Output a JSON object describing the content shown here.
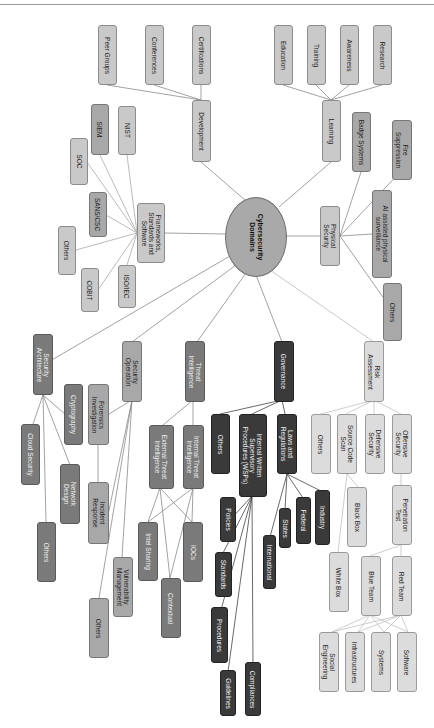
{
  "header": {
    "note": ""
  },
  "center": {
    "label": "Cybersecurity\nDomains"
  },
  "colors": {
    "light": "#c9c9c9",
    "lighter": "#dcdcdc",
    "mid": "#7a7a7a",
    "midlight": "#a8a8a8",
    "dark": "#3a3a3a",
    "edge": "#8a8a8a"
  },
  "nodes": {
    "development": "Development",
    "certifications": "Certifications",
    "conferences": "Conferences",
    "peer_groups": "Peer Groups",
    "learning": "Learning",
    "education": "Education",
    "training": "Training",
    "awareness": "Awareness",
    "research": "Research",
    "badge_systems": "Badge Systems",
    "fire_suppression": "Fire\nSuppression",
    "physical_security": "Physical\nSecurity",
    "ai_surveillance": "AI assisted physical\nsurveillance",
    "physical_others": "Others",
    "frameworks": "Frameworks,\nStandards and\nSoftware",
    "nist": "NIST",
    "siem": "SIEM",
    "soc": "SOC",
    "sans": "SANS/CSC",
    "fw_others": "Others",
    "cobit": "COBIT",
    "iso": "ISO/IEC",
    "security_architecture": "Security\nArchitecture",
    "cryptography": "Cryptography",
    "cloud_security": "Cloud Security",
    "network_design": "Network\nDesign",
    "arch_others": "Others",
    "security_operation": "Security\nOperation",
    "forensics": "Forensics\nInvestigation",
    "incident_response": "Incident\nResponse",
    "vulnerability_management": "Vulnerability\nManagement",
    "ops_others": "Others",
    "threat_intelligence": "Threat\nIntelligence",
    "external_ti": "External Threat\nIntelligence",
    "internal_ti": "Internal Threat\nIntelligence",
    "intel_sharing": "Intel Sharing",
    "iocs": "IOCs",
    "contextual": "Contextual",
    "governance": "Governance",
    "gov_others": "Others",
    "wsp": "Internal Written\nSupervisory\nProcedures (WSPs)",
    "laws": "Laws and\nRegulations",
    "policies": "Policies",
    "standards": "Standards",
    "procedures": "Procedures",
    "guidelines": "Guidelines",
    "compliances": "Compliances",
    "international": "International",
    "states": "States",
    "federal": "Federal",
    "industry": "Industry",
    "risk_assessment": "Risk\nAssessment",
    "risk_others": "Others",
    "source_code_scan": "Source Code\nScan",
    "defensive_security": "Defensive\nSecurity",
    "offensive_security": "Offensive\nSecurity",
    "black_box": "Black Box",
    "white_box": "White Box",
    "penetration_test": "Penetration\nTest",
    "blue_team": "Blue Team",
    "red_team": "Red Team",
    "social_engineering": "Social\nEngineering",
    "infrastructures": "Infrastructures",
    "systems": "Systems",
    "software": "Software"
  }
}
